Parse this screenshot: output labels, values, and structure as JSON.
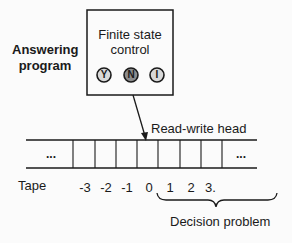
{
  "diagram": {
    "type": "turing-machine",
    "answering_program_label": [
      "Answering",
      "program"
    ],
    "control_box": {
      "title_line1": "Finite state",
      "title_line2": "control",
      "states": [
        {
          "symbol": "Y",
          "fill": "#d9d9d9"
        },
        {
          "symbol": "N",
          "fill": "#8c8c8c"
        },
        {
          "symbol": "I",
          "fill": "#d9d9d9"
        }
      ]
    },
    "head_label": "Read-write head",
    "tape": {
      "label": "Tape",
      "left_ellipsis": "...",
      "right_ellipsis": "...",
      "indices": [
        "-3",
        "-2",
        "-1",
        "0",
        "1",
        "2",
        "3"
      ],
      "indices_trailing_mark": "."
    },
    "brace_label": "Decision problem",
    "colors": {
      "line": "#1a1a1a",
      "background": "#fbfbfb",
      "state_light": "#d9d9d9",
      "state_dark": "#8c8c8c"
    }
  }
}
